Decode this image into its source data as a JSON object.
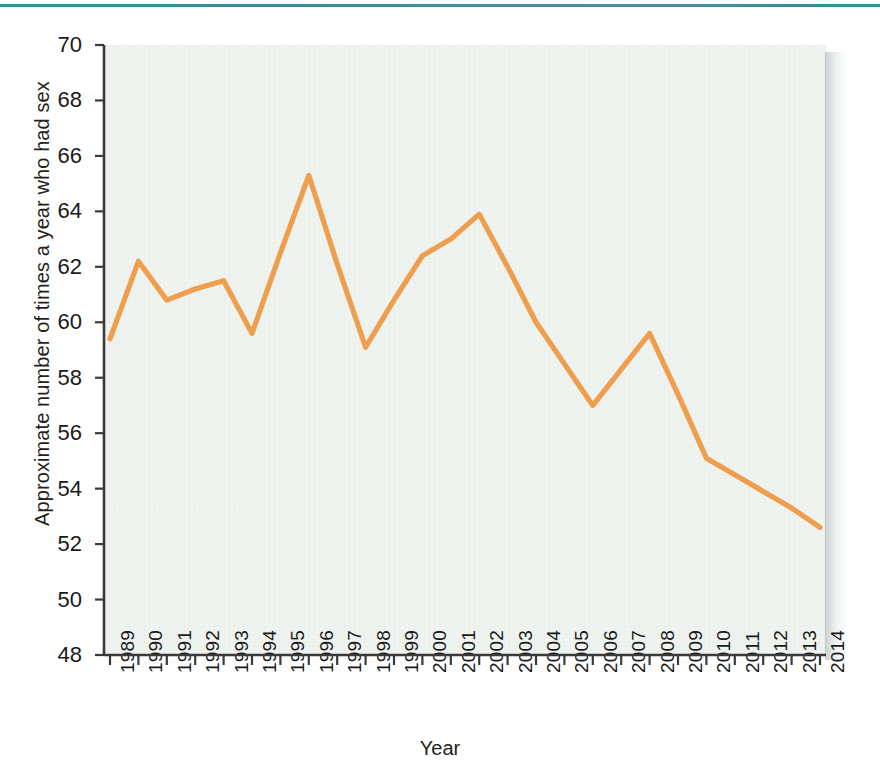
{
  "figure": {
    "background_color": "#ffffff",
    "plot_background_color": "#f0f4f1",
    "rule_color": "#2f8f92",
    "axis_color": "#3a3a3a"
  },
  "chart_data": {
    "type": "line",
    "title": "",
    "xlabel": "Year",
    "ylabel": "Approximate number of times a year who had sex",
    "xlim": [
      1989,
      2014
    ],
    "ylim": [
      48,
      70
    ],
    "ytick_step": 2,
    "grid": false,
    "legend": "none",
    "line_color": "#ef9e4e",
    "line_width": 5,
    "categories": [
      "1989",
      "1990",
      "1991",
      "1992",
      "1993",
      "1994",
      "1995",
      "1996",
      "1997",
      "1998",
      "1999",
      "2000",
      "2001",
      "2002",
      "2003",
      "2004",
      "2005",
      "2006",
      "2007",
      "2008",
      "2009",
      "2010",
      "2011",
      "2012",
      "2013",
      "2014"
    ],
    "yticks": [
      48,
      50,
      52,
      54,
      56,
      58,
      60,
      62,
      64,
      66,
      68,
      70
    ],
    "series": [
      {
        "name": "Approximate number of times a year who had sex",
        "values": [
          59.4,
          62.2,
          60.8,
          61.2,
          61.5,
          59.6,
          62.5,
          65.3,
          62.1,
          59.1,
          60.8,
          62.4,
          63.0,
          63.9,
          62.0,
          60.0,
          58.5,
          57.0,
          58.3,
          59.6,
          57.4,
          55.1,
          54.5,
          53.9,
          53.3,
          52.6
        ]
      }
    ]
  }
}
